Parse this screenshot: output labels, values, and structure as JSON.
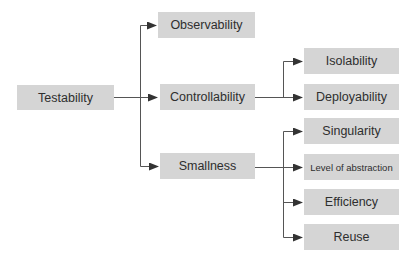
{
  "diagram": {
    "type": "tree",
    "colors": {
      "node_fill": "#d5d5d5",
      "node_text": "#2e2e2e",
      "edge": "#555555"
    },
    "root": {
      "label": "Testability"
    },
    "level1": [
      {
        "label": "Observability"
      },
      {
        "label": "Controllability"
      },
      {
        "label": "Smallness"
      }
    ],
    "controllability_children": [
      {
        "label": "Isolability"
      },
      {
        "label": "Deployability"
      }
    ],
    "smallness_children": [
      {
        "label": "Singularity"
      },
      {
        "label": "Level of abstraction"
      },
      {
        "label": "Efficiency"
      },
      {
        "label": "Reuse"
      }
    ],
    "edges": [
      {
        "from": "Testability",
        "to": "Observability"
      },
      {
        "from": "Testability",
        "to": "Controllability"
      },
      {
        "from": "Testability",
        "to": "Smallness"
      },
      {
        "from": "Controllability",
        "to": "Isolability"
      },
      {
        "from": "Controllability",
        "to": "Deployability"
      },
      {
        "from": "Smallness",
        "to": "Singularity"
      },
      {
        "from": "Smallness",
        "to": "Level of abstraction"
      },
      {
        "from": "Smallness",
        "to": "Efficiency"
      },
      {
        "from": "Smallness",
        "to": "Reuse"
      }
    ]
  }
}
